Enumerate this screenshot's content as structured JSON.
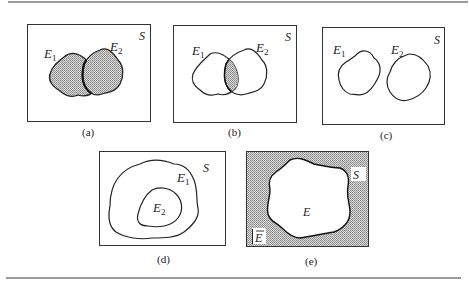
{
  "colors": {
    "ink": "#2a2a2a",
    "shade": "#b8b8b8",
    "rule": "#777777"
  },
  "panels": [
    {
      "id": "a",
      "caption": "(a)",
      "space": "S",
      "sets": [
        "E",
        "E"
      ],
      "subs": [
        "1",
        "2"
      ],
      "description": "Union E1 ∪ E2 shaded"
    },
    {
      "id": "b",
      "caption": "(b)",
      "space": "S",
      "sets": [
        "E",
        "E"
      ],
      "subs": [
        "1",
        "2"
      ],
      "description": "Intersection E1 ∩ E2 shaded"
    },
    {
      "id": "c",
      "caption": "(c)",
      "space": "S",
      "sets": [
        "E",
        "E"
      ],
      "subs": [
        "1",
        "2"
      ],
      "description": "Mutually exclusive events"
    },
    {
      "id": "d",
      "caption": "(d)",
      "space": "S",
      "sets": [
        "E",
        "E"
      ],
      "subs": [
        "1",
        "2"
      ],
      "description": "E2 contained in E1"
    },
    {
      "id": "e",
      "caption": "(e)",
      "space": "S",
      "sets": [
        "E"
      ],
      "complement": "E",
      "description": "Complement of E shaded"
    }
  ]
}
